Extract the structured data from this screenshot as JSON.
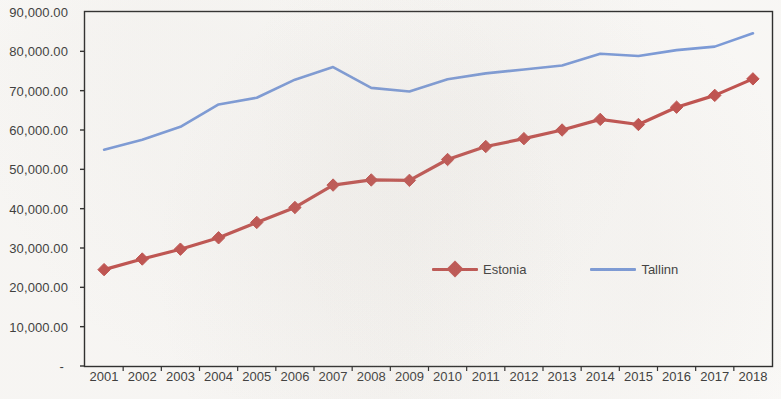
{
  "chart_data": {
    "type": "line",
    "title": "",
    "subtitle": "",
    "xlabel": "",
    "ylabel": "",
    "categories": [
      "2001",
      "2002",
      "2003",
      "2004",
      "2005",
      "2006",
      "2007",
      "2008",
      "2009",
      "2010",
      "2011",
      "2012",
      "2013",
      "2014",
      "2015",
      "2016",
      "2017",
      "2018"
    ],
    "series": [
      {
        "name": "Estonia",
        "color": "#C0504D",
        "marker": "diamond",
        "values": [
          24500,
          27200,
          29700,
          32600,
          36500,
          40300,
          46000,
          47300,
          47200,
          52500,
          55800,
          57800,
          60000,
          62700,
          61400,
          65800,
          68800,
          73000
        ]
      },
      {
        "name": "Tallinn",
        "color": "#7A9AD9",
        "marker": "none",
        "values": [
          55000,
          57500,
          60800,
          66500,
          68200,
          72800,
          76000,
          70700,
          69800,
          72900,
          74400,
          75400,
          76400,
          79400,
          78800,
          80300,
          81200,
          84600
        ]
      }
    ],
    "ylim": [
      0,
      90000
    ],
    "yticks": [
      0,
      10000,
      20000,
      30000,
      40000,
      50000,
      60000,
      70000,
      80000,
      90000
    ],
    "ytick_labels": [
      "-",
      "10,000.00",
      "20,000.00",
      "30,000.00",
      "40,000.00",
      "50,000.00",
      "60,000.00",
      "70,000.00",
      "80,000.00",
      "90,000.00"
    ],
    "grid": false,
    "legend_position": "inside-center",
    "plot_border": true,
    "border_color": "#2b2b2b",
    "background": "#fbfaf8"
  },
  "legend": {
    "entries": [
      {
        "label": "Estonia"
      },
      {
        "label": "Tallinn"
      }
    ]
  }
}
